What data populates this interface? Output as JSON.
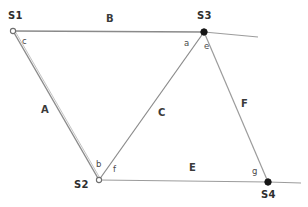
{
  "diagram": {
    "kind": "survey-traverse-diagram",
    "background_color": "#ffffff",
    "line_color": "#8a8a8a",
    "text_color": "#3a3a3a",
    "stations": [
      {
        "id": "S1",
        "label": "S1",
        "x": 13,
        "y": 31,
        "marker": "open-circle",
        "label_x": 8,
        "label_y": 11
      },
      {
        "id": "S2",
        "label": "S2",
        "x": 99,
        "y": 180,
        "marker": "open-circle",
        "label_x": 74,
        "label_y": 180
      },
      {
        "id": "S3",
        "label": "S3",
        "x": 204,
        "y": 32,
        "marker": "filled-circle",
        "label_x": 197,
        "label_y": 11
      },
      {
        "id": "S4",
        "label": "S4",
        "x": 268,
        "y": 182,
        "marker": "filled-circle",
        "label_x": 261,
        "label_y": 190
      }
    ],
    "segments": [
      {
        "id": "A",
        "label": "A",
        "from": "S1",
        "to": "S2",
        "label_x": 41,
        "label_y": 105
      },
      {
        "id": "B",
        "label": "B",
        "from": "S1",
        "to": "S3",
        "label_x": 106,
        "label_y": 14
      },
      {
        "id": "C",
        "label": "C",
        "from": "S2",
        "to": "S3",
        "label_x": 158,
        "label_y": 108
      },
      {
        "id": "E",
        "label": "E",
        "from": "S2",
        "to": "S4",
        "label_x": 189,
        "label_y": 163
      },
      {
        "id": "F",
        "label": "F",
        "from": "S3",
        "to": "S4",
        "label_x": 241,
        "label_y": 99
      }
    ],
    "extensions": [
      {
        "id": "B-extension",
        "from": "S3",
        "to_x": 258,
        "to_y": 37
      },
      {
        "id": "E-extension",
        "from": "S4",
        "to_x": 301,
        "to_y": 183
      }
    ],
    "angles": [
      {
        "id": "c",
        "label": "c",
        "at": "S1",
        "label_x": 22,
        "label_y": 37
      },
      {
        "id": "a",
        "label": "a",
        "at": "S3",
        "label_x": 184,
        "label_y": 39
      },
      {
        "id": "e",
        "label": "e",
        "at": "S3",
        "label_x": 204,
        "label_y": 42
      },
      {
        "id": "b",
        "label": "b",
        "at": "S2",
        "label_x": 96,
        "label_y": 160
      },
      {
        "id": "f",
        "label": "f",
        "at": "S2",
        "label_x": 113,
        "label_y": 165
      },
      {
        "id": "g",
        "label": "g",
        "at": "S4",
        "label_x": 252,
        "label_y": 167
      }
    ]
  }
}
